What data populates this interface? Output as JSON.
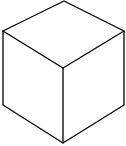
{
  "figure": {
    "type": "isometric-cube-line-drawing",
    "stroke_color": "#000000",
    "background_color": "#ffffff",
    "stroke_width": 1.3,
    "vertices": {
      "top": [
        64,
        1
      ],
      "left_top": [
        3,
        31
      ],
      "right_top": [
        124,
        31
      ],
      "center": [
        63,
        68
      ],
      "left_bottom": [
        3,
        105
      ],
      "right_bottom": [
        124,
        105
      ],
      "bottom": [
        63,
        143
      ]
    },
    "faces": [
      "top",
      "left",
      "right"
    ]
  }
}
